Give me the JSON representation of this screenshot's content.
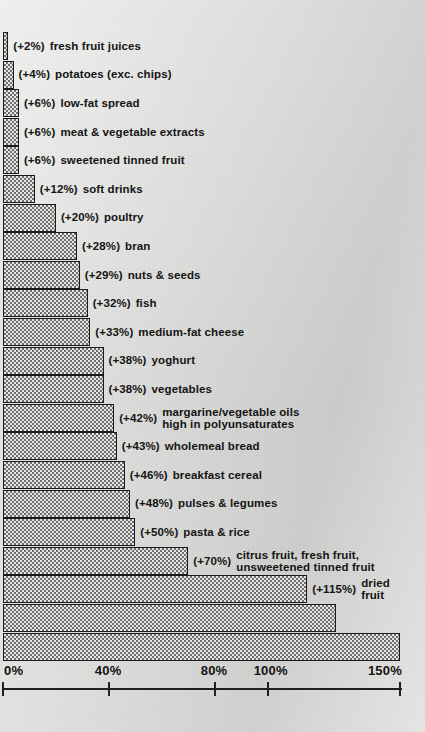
{
  "figure": {
    "type": "scanned-bar-chart",
    "orientation": "horizontal"
  },
  "chart_data": {
    "type": "bar",
    "title": "",
    "xlabel": "",
    "ylabel": "",
    "xlim": [
      0,
      150
    ],
    "grid": false,
    "legend": null,
    "orientation": "horizontal",
    "value_prefix": "(+",
    "value_suffix": "%)",
    "tick_labels": [
      "0%",
      "40%",
      "80%",
      "100%",
      "150%"
    ],
    "ticks": [
      0,
      40,
      80,
      100,
      150
    ],
    "categories": [
      "fresh fruit juices",
      "potatoes (exc. chips)",
      "low-fat spread",
      "meat & vegetable extracts",
      "sweetened tinned fruit",
      "soft drinks",
      "poultry",
      "bran",
      "nuts & seeds",
      "fish",
      "medium-fat cheese",
      "yoghurt",
      "vegetables",
      "margarine/vegetable oils high in polyunsaturates",
      "wholemeal bread",
      "breakfast cereal",
      "pulses & legumes",
      "pasta & rice",
      "citrus fruit, fresh fruit, unsweetened tinned fruit",
      "dried fruit",
      "skimmed milk",
      "low-fat cheese"
    ],
    "values": [
      2,
      4,
      6,
      6,
      6,
      12,
      20,
      28,
      29,
      32,
      33,
      38,
      38,
      42,
      43,
      46,
      48,
      50,
      70,
      115,
      126,
      150
    ]
  },
  "bars": [
    {
      "value_label": "(+2%)",
      "name": "fresh fruit juices",
      "name2": "",
      "value": 2,
      "label_inside": false
    },
    {
      "value_label": "(+4%)",
      "name": "potatoes (exc. chips)",
      "name2": "",
      "value": 4,
      "label_inside": false
    },
    {
      "value_label": "(+6%)",
      "name": "low-fat spread",
      "name2": "",
      "value": 6,
      "label_inside": false
    },
    {
      "value_label": "(+6%)",
      "name": "meat & vegetable extracts",
      "name2": "",
      "value": 6,
      "label_inside": false
    },
    {
      "value_label": "(+6%)",
      "name": "sweetened tinned fruit",
      "name2": "",
      "value": 6,
      "label_inside": false
    },
    {
      "value_label": "(+12%)",
      "name": "soft drinks",
      "name2": "",
      "value": 12,
      "label_inside": false
    },
    {
      "value_label": "(+20%)",
      "name": "poultry",
      "name2": "",
      "value": 20,
      "label_inside": false
    },
    {
      "value_label": "(+28%)",
      "name": "bran",
      "name2": "",
      "value": 28,
      "label_inside": false
    },
    {
      "value_label": "(+29%)",
      "name": "nuts & seeds",
      "name2": "",
      "value": 29,
      "label_inside": false
    },
    {
      "value_label": "(+32%)",
      "name": "fish",
      "name2": "",
      "value": 32,
      "label_inside": false
    },
    {
      "value_label": "(+33%)",
      "name": "medium-fat cheese",
      "name2": "",
      "value": 33,
      "label_inside": false
    },
    {
      "value_label": "(+38%)",
      "name": "yoghurt",
      "name2": "",
      "value": 38,
      "label_inside": false
    },
    {
      "value_label": "(+38%)",
      "name": "vegetables",
      "name2": "",
      "value": 38,
      "label_inside": false
    },
    {
      "value_label": "(+42%)",
      "name": "margarine/vegetable oils",
      "name2": "high in polyunsaturates",
      "value": 42,
      "label_inside": false
    },
    {
      "value_label": "(+43%)",
      "name": "wholemeal bread",
      "name2": "",
      "value": 43,
      "label_inside": false
    },
    {
      "value_label": "(+46%)",
      "name": "breakfast cereal",
      "name2": "",
      "value": 46,
      "label_inside": false
    },
    {
      "value_label": "(+48%)",
      "name": "pulses & legumes",
      "name2": "",
      "value": 48,
      "label_inside": false
    },
    {
      "value_label": "(+50%)",
      "name": "pasta & rice",
      "name2": "",
      "value": 50,
      "label_inside": false
    },
    {
      "value_label": "(+70%)",
      "name": "citrus fruit, fresh fruit,",
      "name2": "unsweetened tinned fruit",
      "value": 70,
      "label_inside": false
    },
    {
      "value_label": "(+115%)",
      "name": "dried",
      "name2": "fruit",
      "value": 115,
      "label_inside": false
    },
    {
      "value_label": "(+126%)",
      "name": "skimmed milk",
      "name2": "",
      "value": 126,
      "label_inside": true
    },
    {
      "value_label": "(+150%)",
      "name": "low-fat cheese",
      "name2": "",
      "value": 150,
      "label_inside": true
    }
  ],
  "axis": {
    "ticks": [
      {
        "label": "0%",
        "value": 0
      },
      {
        "label": "40%",
        "value": 40
      },
      {
        "label": "80%",
        "value": 80
      },
      {
        "label": "100%",
        "value": 100
      },
      {
        "label": "150%",
        "value": 150
      }
    ]
  },
  "colors": {
    "bar_fill_light": "#e4e4e2",
    "bar_fill_dark": "#6f6f6d",
    "bar_border": "#1a1a1a",
    "text": "#141414",
    "page_background": "#d8d8d6"
  }
}
